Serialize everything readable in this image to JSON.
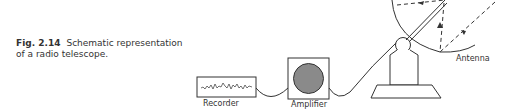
{
  "caption": {
    "figure_number": "Fig. 2.14",
    "text": "Schematic representation of a radio telescope."
  },
  "labels": {
    "recorder": "Recorder",
    "amplifier": "Amplifier",
    "antenna": "Antenna"
  },
  "colors": {
    "line": "#333333",
    "amplifier_fill": "#8a8a8a"
  }
}
